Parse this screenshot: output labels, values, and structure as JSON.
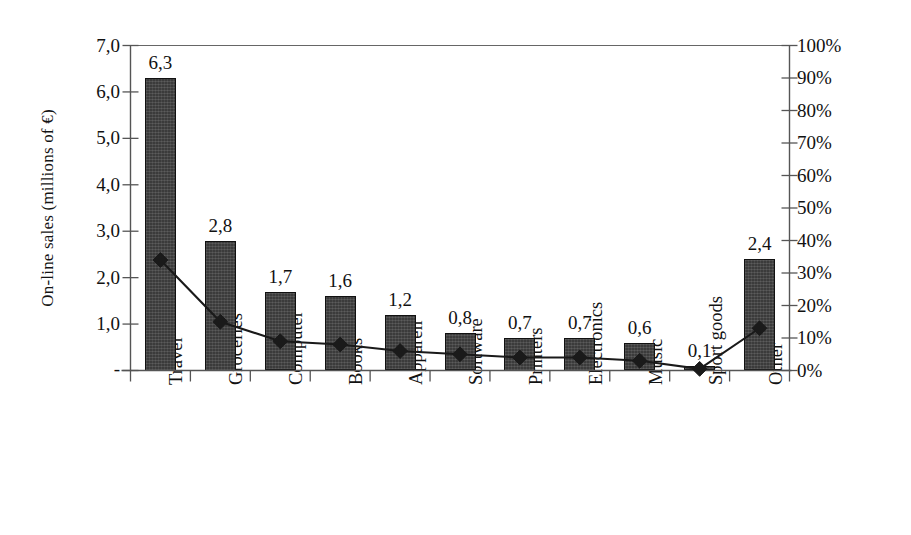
{
  "chart_data": {
    "type": "bar",
    "title": "",
    "subtitle": "",
    "categories": [
      "Travel",
      "Groceries",
      "Computer",
      "Books",
      "Appareil",
      "Software",
      "Printers",
      "Electronics",
      "Music",
      "Sport goods",
      "Other"
    ],
    "series": [
      {
        "name": "On-line sales (millions of €)",
        "type": "bar",
        "axis": "left",
        "values": [
          6.3,
          2.8,
          1.7,
          1.6,
          1.2,
          0.8,
          0.7,
          0.7,
          0.6,
          0.1,
          2.4
        ],
        "data_labels": [
          "6,3",
          "2,8",
          "1,7",
          "1,6",
          "1,2",
          "0,8",
          "0,7",
          "0,7",
          "0,6",
          "0,1",
          "2,4"
        ]
      },
      {
        "name": "Percentage of on-line sales on total sales",
        "type": "line",
        "axis": "right",
        "marker": "diamond",
        "values": [
          34,
          15,
          9,
          8,
          6,
          5,
          4,
          4,
          3,
          0.5,
          13
        ]
      }
    ],
    "xlabel": "",
    "ylabel": "On-line sales (millions of €)",
    "y2label": "Percentage of on-line sales on total sales",
    "ylim": [
      0,
      7
    ],
    "y2lim": [
      0,
      100
    ],
    "y_ticks": [
      "-",
      "1,0",
      "2,0",
      "3,0",
      "4,0",
      "5,0",
      "6,0",
      "7,0"
    ],
    "y2_ticks": [
      "0%",
      "10%",
      "20%",
      "30%",
      "40%",
      "50%",
      "60%",
      "70%",
      "80%",
      "90%",
      "100%"
    ],
    "grid": false,
    "legend": "none",
    "bar_color": "#3b3b3b",
    "line_color": "#111111"
  },
  "axes": {
    "left_title": "On-line sales (millions of €)",
    "right_title": "Percentage of on-line sales on total sales",
    "left_ticks": [
      "7,0",
      "6,0",
      "5,0",
      "4,0",
      "3,0",
      "2,0",
      "1,0",
      "-"
    ],
    "right_ticks": [
      "100%",
      "90%",
      "80%",
      "70%",
      "60%",
      "50%",
      "40%",
      "30%",
      "20%",
      "10%",
      "0%"
    ]
  }
}
